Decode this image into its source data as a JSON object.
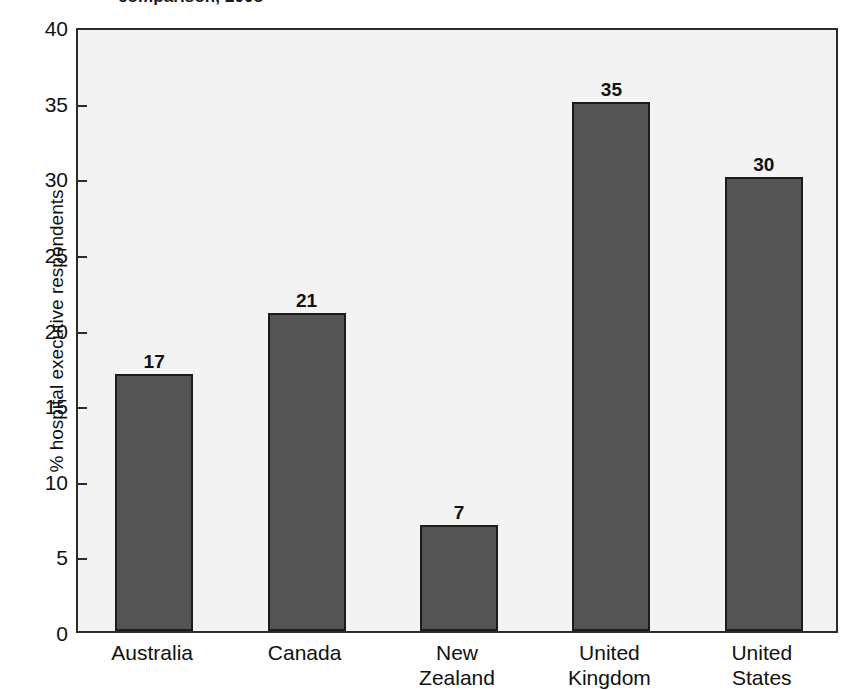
{
  "chart_data": {
    "type": "bar",
    "title": "comparison, 2008",
    "title_note": "title is cropped at the top edge of the screenshot; only the lower portion of the glyphs is visible",
    "xlabel": "",
    "ylabel": "% hospital executive respondents",
    "categories": [
      "Australia",
      "Canada",
      "New Zealand",
      "United Kingdom",
      "United States"
    ],
    "category_lines": [
      [
        "Australia"
      ],
      [
        "Canada"
      ],
      [
        "New",
        "Zealand"
      ],
      [
        "United",
        "Kingdom"
      ],
      [
        "United",
        "States"
      ]
    ],
    "values": [
      17,
      21,
      7,
      35,
      30
    ],
    "value_labels": [
      "17",
      "21",
      "7",
      "35",
      "30"
    ],
    "ylim": [
      0,
      40
    ],
    "yticks": [
      0,
      5,
      10,
      15,
      20,
      25,
      30,
      35,
      40
    ],
    "ytick_labels": [
      "0",
      "5",
      "10",
      "15",
      "20",
      "25",
      "30",
      "35",
      "40"
    ],
    "grid": false,
    "legend": null,
    "colors": {
      "bar_fill": "#545454",
      "bar_outline": "#1c1c1c",
      "plot_background": "#f3f3f3",
      "plot_border": "#2b2b2b",
      "text": "#111111",
      "page_background": "#ffffff"
    }
  }
}
